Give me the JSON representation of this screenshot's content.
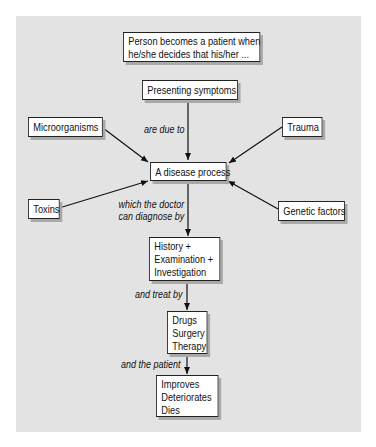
{
  "diagram": {
    "type": "concept-map",
    "background_color": "#e3e3e3",
    "nodes": {
      "intro": {
        "lines": [
          "Person becomes a patient when",
          "he/she decides that  his/her ..."
        ]
      },
      "symptoms": {
        "label": "Presenting symptoms"
      },
      "microorganisms": {
        "label": "Microorganisms"
      },
      "trauma": {
        "label": "Trauma"
      },
      "disease": {
        "label": "A disease process"
      },
      "toxins": {
        "label": "Toxins"
      },
      "genetic": {
        "label": "Genetic factors"
      },
      "diagnosis": {
        "lines": [
          "History +",
          "Examination +",
          "Investigation"
        ]
      },
      "treatment": {
        "lines": [
          "Drugs",
          "Surgery",
          "Therapy"
        ]
      },
      "outcome": {
        "lines": [
          "Improves",
          "Deteriorates",
          "Dies"
        ]
      }
    },
    "edge_labels": {
      "due_to": "are due to",
      "diagnose": [
        "which the doctor",
        "can diagnose by"
      ],
      "treat": "and treat by",
      "patient": "and the patient"
    },
    "edges": [
      {
        "from": "symptoms",
        "to": "disease",
        "label": "are due to"
      },
      {
        "from": "microorganisms",
        "to": "disease"
      },
      {
        "from": "trauma",
        "to": "disease"
      },
      {
        "from": "toxins",
        "to": "disease"
      },
      {
        "from": "genetic",
        "to": "disease"
      },
      {
        "from": "disease",
        "to": "diagnosis",
        "label": "which the doctor can diagnose by"
      },
      {
        "from": "diagnosis",
        "to": "treatment",
        "label": "and treat by"
      },
      {
        "from": "treatment",
        "to": "outcome",
        "label": "and the patient"
      }
    ]
  }
}
